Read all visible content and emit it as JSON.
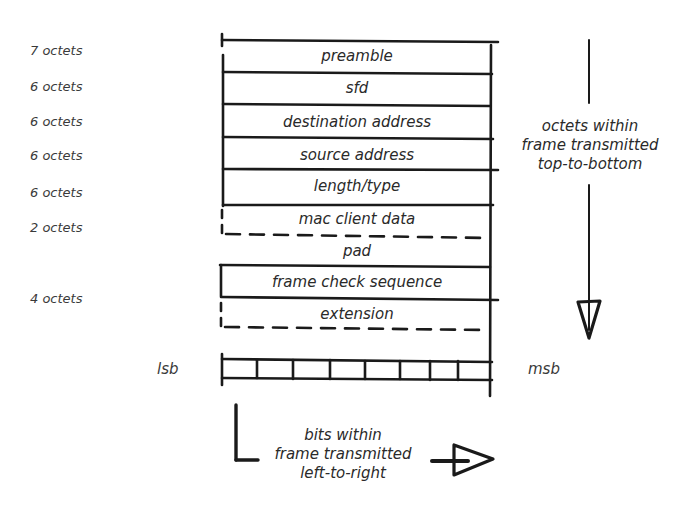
{
  "diagram": {
    "title": "",
    "fields": [
      {
        "name": "preamble",
        "size": "7 octets",
        "border": "solid"
      },
      {
        "name": "sfd",
        "size": "6 octets",
        "border": "solid"
      },
      {
        "name": "destination address",
        "size": "6 octets",
        "border": "solid"
      },
      {
        "name": "source address",
        "size": "6 octets",
        "border": "solid"
      },
      {
        "name": "length/type",
        "size": "6 octets",
        "border": "solid"
      },
      {
        "name": "mac client data",
        "size": "2 octets",
        "border": "dashed"
      },
      {
        "name": "pad",
        "size": "",
        "border": "none"
      },
      {
        "name": "frame check sequence",
        "size": "4 octets",
        "border": "solid"
      },
      {
        "name": "extension",
        "size": "",
        "border": "dashed"
      }
    ],
    "bits": {
      "lsb_label": "lsb",
      "msb_label": "msb",
      "cell_count": 8
    },
    "vertical_note": {
      "line1": "octets within",
      "line2": "frame transmitted",
      "line3": "top-to-bottom"
    },
    "horizontal_note": {
      "line1": "bits within",
      "line2": "frame transmitted",
      "line3": "left-to-right"
    },
    "ink_color": "#1a1a1a"
  }
}
